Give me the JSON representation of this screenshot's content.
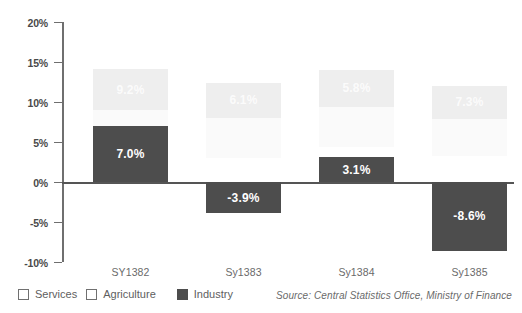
{
  "chart_data": {
    "type": "bar",
    "title": "",
    "xlabel": "",
    "ylabel": "",
    "ylim": [
      -10,
      20
    ],
    "ytick_step": 5,
    "grid": false,
    "legend_position": "bottom-left",
    "categories": [
      "SY1382",
      "Sy1383",
      "Sy1384",
      "Sy1385"
    ],
    "ytick_labels": [
      "20%",
      "15%",
      "10%",
      "5%",
      "0%",
      "-5%",
      "-10%"
    ],
    "ytick_values": [
      20,
      15,
      10,
      5,
      0,
      -5,
      -10
    ],
    "series": [
      {
        "name": "Services",
        "color": "#eeeeee",
        "values": [
          9.2,
          6.1,
          5.8,
          7.3
        ],
        "labels": [
          "9.2%",
          "6.1%",
          "5.8%",
          "7.3%"
        ],
        "bar_bottoms": [
          9.0,
          8.0,
          9.4,
          7.9
        ],
        "bar_tops": [
          14.1,
          12.4,
          14.0,
          12.0
        ]
      },
      {
        "name": "Agriculture",
        "color": "#fafafa",
        "values": [
          null,
          null,
          null,
          null
        ],
        "labels": [
          "",
          "",
          "",
          ""
        ],
        "bar_bottoms": [
          4.2,
          3.0,
          4.4,
          3.2
        ],
        "bar_tops": [
          9.0,
          8.0,
          9.4,
          7.9
        ]
      },
      {
        "name": "Industry",
        "color": "#4d4d4d",
        "values": [
          7.0,
          -3.9,
          3.1,
          -8.6
        ],
        "labels": [
          "7.0%",
          "-3.9%",
          "3.1%",
          "-8.6%"
        ],
        "bar_bottoms": [
          0,
          -3.9,
          0,
          -8.6
        ],
        "bar_tops": [
          7.0,
          0,
          3.1,
          0
        ]
      }
    ]
  },
  "legend": {
    "items": [
      {
        "label": "Services",
        "swatch": "outline"
      },
      {
        "label": "Agriculture",
        "swatch": "outline"
      },
      {
        "label": "Industry",
        "swatch": "filled"
      }
    ]
  },
  "source": {
    "text": "Source: Central Statistics Office, Ministry of Finance"
  }
}
